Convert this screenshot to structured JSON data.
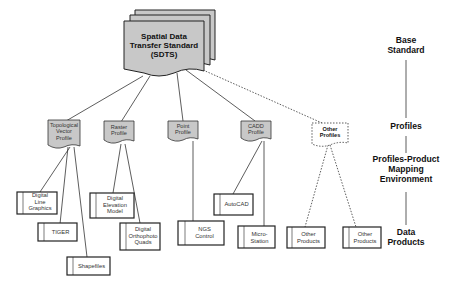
{
  "diagram": {
    "base": {
      "label_lines": [
        "Spatial Data",
        "Transfer Standard",
        "(SDTS)"
      ]
    },
    "profiles": [
      {
        "id": "topological",
        "lines": [
          "Topological",
          "Vector",
          "Profile"
        ],
        "style": "solid"
      },
      {
        "id": "raster",
        "lines": [
          "Raster",
          "Profile"
        ],
        "style": "solid"
      },
      {
        "id": "point",
        "lines": [
          "Point",
          "Profile"
        ],
        "style": "solid"
      },
      {
        "id": "cadd",
        "lines": [
          "CADD",
          "Profile"
        ],
        "style": "solid"
      },
      {
        "id": "other",
        "lines": [
          "Other",
          "Profiles"
        ],
        "style": "dashed"
      }
    ],
    "products": [
      {
        "id": "dlg",
        "parent": "topological",
        "lines": [
          "Digital",
          "Line",
          "Graphics"
        ]
      },
      {
        "id": "tiger",
        "parent": "topological",
        "lines": [
          "TIGER"
        ]
      },
      {
        "id": "shapefiles",
        "parent": "topological",
        "lines": [
          "Shapefiles"
        ]
      },
      {
        "id": "dem",
        "parent": "raster",
        "lines": [
          "Digital",
          "Elevation",
          "Model"
        ]
      },
      {
        "id": "doq",
        "parent": "raster",
        "lines": [
          "Digital",
          "Orthophoto",
          "Quads"
        ]
      },
      {
        "id": "ngs",
        "parent": "point",
        "lines": [
          "NGS",
          "Control"
        ]
      },
      {
        "id": "autocad",
        "parent": "cadd",
        "lines": [
          "AutoCAD"
        ]
      },
      {
        "id": "microstation",
        "parent": "cadd",
        "lines": [
          "Micro-",
          "Station"
        ]
      },
      {
        "id": "other1",
        "parent": "other",
        "lines": [
          "Other",
          "Products"
        ]
      },
      {
        "id": "other2",
        "parent": "other",
        "lines": [
          "Other",
          "Products"
        ]
      }
    ],
    "legend": {
      "base_standard": [
        "Base",
        "Standard"
      ],
      "profiles": [
        "Profiles"
      ],
      "mapping": [
        "Profiles-Product",
        "Mapping",
        "Environment"
      ],
      "data_products": [
        "Data",
        "Products"
      ]
    },
    "colors": {
      "doc_fill": "#c8c8c8",
      "stroke": "#222222",
      "background": "#ffffff"
    }
  }
}
